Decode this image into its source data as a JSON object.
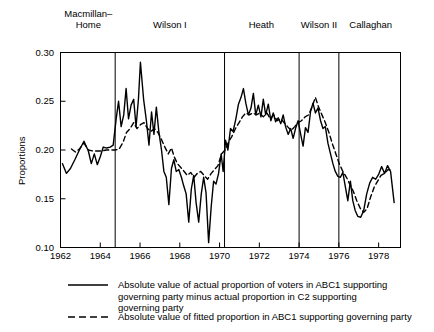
{
  "chart_data": {
    "type": "line",
    "title": "",
    "xlabel": "",
    "ylabel": "Proportions",
    "xlim": [
      1962.0,
      1979.1
    ],
    "ylim": [
      0.1,
      0.3
    ],
    "grid": false,
    "legend_position": "below-plot",
    "ytick_labels": [
      "0.30",
      "0.25",
      "0.20",
      "0.15",
      "0.10"
    ],
    "ytick_values": [
      0.3,
      0.25,
      0.2,
      0.15,
      0.1
    ],
    "xtick_labels": [
      "1962",
      "1964",
      "1966",
      "1968",
      "1970",
      "1972",
      "1974",
      "1976",
      "1978"
    ],
    "xtick_values": [
      1962,
      1964,
      1966,
      1968,
      1970,
      1972,
      1974,
      1976,
      1978
    ],
    "era_dividers": [
      1964.75,
      1970.25,
      1974.0,
      1976.0
    ],
    "eras": [
      {
        "label": "Macmillan–\nHome",
        "center": 1963.4
      },
      {
        "label": "Wilson I",
        "center": 1967.5
      },
      {
        "label": "Heath",
        "center": 1972.1
      },
      {
        "label": "Wilson II",
        "center": 1975.0
      },
      {
        "label": "Callaghan",
        "center": 1977.6
      }
    ],
    "series": [
      {
        "name": "actual",
        "style": "solid",
        "color": "#000000",
        "legend": "Absolute value of actual proportion of voters in ABC1 supporting governing party minus actual proportion in C2 supporting governing party",
        "points": [
          [
            1962.1,
            0.186
          ],
          [
            1962.3,
            0.176
          ],
          [
            1962.5,
            0.181
          ],
          [
            1962.72,
            0.19
          ],
          [
            1962.95,
            0.2
          ],
          [
            1963.18,
            0.209
          ],
          [
            1963.4,
            0.199
          ],
          [
            1963.55,
            0.186
          ],
          [
            1963.7,
            0.196
          ],
          [
            1963.85,
            0.185
          ],
          [
            1964.0,
            0.193
          ],
          [
            1964.15,
            0.203
          ],
          [
            1964.32,
            0.202
          ],
          [
            1964.5,
            0.203
          ],
          [
            1964.65,
            0.205
          ],
          [
            1964.8,
            0.232
          ],
          [
            1964.92,
            0.25
          ],
          [
            1965.05,
            0.224
          ],
          [
            1965.18,
            0.236
          ],
          [
            1965.3,
            0.263
          ],
          [
            1965.42,
            0.232
          ],
          [
            1965.55,
            0.246
          ],
          [
            1965.68,
            0.252
          ],
          [
            1965.8,
            0.224
          ],
          [
            1965.92,
            0.252
          ],
          [
            1966.02,
            0.29
          ],
          [
            1966.18,
            0.252
          ],
          [
            1966.32,
            0.23
          ],
          [
            1966.45,
            0.205
          ],
          [
            1966.58,
            0.239
          ],
          [
            1966.7,
            0.216
          ],
          [
            1966.82,
            0.244
          ],
          [
            1966.95,
            0.218
          ],
          [
            1967.08,
            0.2
          ],
          [
            1967.2,
            0.178
          ],
          [
            1967.32,
            0.172
          ],
          [
            1967.45,
            0.144
          ],
          [
            1967.58,
            0.181
          ],
          [
            1967.7,
            0.19
          ],
          [
            1967.82,
            0.178
          ],
          [
            1967.95,
            0.18
          ],
          [
            1968.08,
            0.172
          ],
          [
            1968.2,
            0.163
          ],
          [
            1968.32,
            0.155
          ],
          [
            1968.45,
            0.126
          ],
          [
            1968.58,
            0.16
          ],
          [
            1968.7,
            0.174
          ],
          [
            1968.82,
            0.146
          ],
          [
            1968.95,
            0.126
          ],
          [
            1969.08,
            0.155
          ],
          [
            1969.2,
            0.172
          ],
          [
            1969.32,
            0.156
          ],
          [
            1969.45,
            0.105
          ],
          [
            1969.58,
            0.142
          ],
          [
            1969.7,
            0.168
          ],
          [
            1969.82,
            0.165
          ],
          [
            1969.95,
            0.176
          ],
          [
            1970.08,
            0.196
          ],
          [
            1970.18,
            0.178
          ],
          [
            1970.3,
            0.21
          ],
          [
            1970.42,
            0.2
          ],
          [
            1970.55,
            0.222
          ],
          [
            1970.68,
            0.219
          ],
          [
            1970.82,
            0.232
          ],
          [
            1970.95,
            0.247
          ],
          [
            1971.08,
            0.254
          ],
          [
            1971.2,
            0.263
          ],
          [
            1971.32,
            0.248
          ],
          [
            1971.45,
            0.236
          ],
          [
            1971.58,
            0.243
          ],
          [
            1971.7,
            0.258
          ],
          [
            1971.82,
            0.236
          ],
          [
            1971.95,
            0.246
          ],
          [
            1972.08,
            0.234
          ],
          [
            1972.2,
            0.252
          ],
          [
            1972.32,
            0.236
          ],
          [
            1972.45,
            0.247
          ],
          [
            1972.58,
            0.23
          ],
          [
            1972.7,
            0.238
          ],
          [
            1972.82,
            0.229
          ],
          [
            1972.95,
            0.233
          ],
          [
            1973.08,
            0.227
          ],
          [
            1973.2,
            0.236
          ],
          [
            1973.32,
            0.224
          ],
          [
            1973.45,
            0.216
          ],
          [
            1973.58,
            0.222
          ],
          [
            1973.7,
            0.212
          ],
          [
            1973.82,
            0.222
          ],
          [
            1973.95,
            0.23
          ],
          [
            1974.08,
            0.216
          ],
          [
            1974.2,
            0.204
          ],
          [
            1974.32,
            0.223
          ],
          [
            1974.45,
            0.218
          ],
          [
            1974.58,
            0.24
          ],
          [
            1974.7,
            0.248
          ],
          [
            1974.82,
            0.238
          ],
          [
            1974.95,
            0.243
          ],
          [
            1975.08,
            0.23
          ],
          [
            1975.2,
            0.222
          ],
          [
            1975.32,
            0.224
          ],
          [
            1975.45,
            0.207
          ],
          [
            1975.58,
            0.196
          ],
          [
            1975.7,
            0.186
          ],
          [
            1975.82,
            0.178
          ],
          [
            1975.95,
            0.173
          ],
          [
            1976.08,
            0.172
          ],
          [
            1976.2,
            0.177
          ],
          [
            1976.32,
            0.163
          ],
          [
            1976.45,
            0.148
          ],
          [
            1976.58,
            0.168
          ],
          [
            1976.7,
            0.148
          ],
          [
            1976.82,
            0.138
          ],
          [
            1976.95,
            0.132
          ],
          [
            1977.1,
            0.131
          ],
          [
            1977.25,
            0.138
          ],
          [
            1977.4,
            0.155
          ],
          [
            1977.55,
            0.166
          ],
          [
            1977.7,
            0.172
          ],
          [
            1977.85,
            0.17
          ],
          [
            1978.0,
            0.175
          ],
          [
            1978.15,
            0.183
          ],
          [
            1978.3,
            0.176
          ],
          [
            1978.45,
            0.184
          ],
          [
            1978.6,
            0.178
          ],
          [
            1978.78,
            0.146
          ]
        ]
      },
      {
        "name": "fitted",
        "style": "dashed",
        "color": "#000000",
        "legend": "Absolute value of fitted proportion in ABC1 supporting governing party",
        "points": [
          [
            1962.55,
            0.201
          ],
          [
            1962.75,
            0.198
          ],
          [
            1962.95,
            0.201
          ],
          [
            1963.18,
            0.207
          ],
          [
            1963.4,
            0.2
          ],
          [
            1963.62,
            0.199
          ],
          [
            1963.85,
            0.199
          ],
          [
            1964.08,
            0.199
          ],
          [
            1964.3,
            0.2
          ],
          [
            1964.52,
            0.2
          ],
          [
            1964.75,
            0.2
          ],
          [
            1964.95,
            0.201
          ],
          [
            1965.15,
            0.208
          ],
          [
            1965.32,
            0.218
          ],
          [
            1965.5,
            0.222
          ],
          [
            1965.68,
            0.228
          ],
          [
            1965.85,
            0.222
          ],
          [
            1966.02,
            0.226
          ],
          [
            1966.2,
            0.228
          ],
          [
            1966.38,
            0.222
          ],
          [
            1966.55,
            0.219
          ],
          [
            1966.72,
            0.222
          ],
          [
            1966.9,
            0.218
          ],
          [
            1967.05,
            0.212
          ],
          [
            1967.25,
            0.203
          ],
          [
            1967.42,
            0.196
          ],
          [
            1967.58,
            0.202
          ],
          [
            1967.72,
            0.193
          ],
          [
            1967.88,
            0.186
          ],
          [
            1968.05,
            0.182
          ],
          [
            1968.22,
            0.178
          ],
          [
            1968.38,
            0.174
          ],
          [
            1968.55,
            0.177
          ],
          [
            1968.72,
            0.172
          ],
          [
            1968.88,
            0.176
          ],
          [
            1969.05,
            0.178
          ],
          [
            1969.22,
            0.174
          ],
          [
            1969.4,
            0.17
          ],
          [
            1969.58,
            0.176
          ],
          [
            1969.75,
            0.18
          ],
          [
            1969.92,
            0.184
          ],
          [
            1970.1,
            0.196
          ],
          [
            1970.28,
            0.2
          ],
          [
            1970.45,
            0.208
          ],
          [
            1970.62,
            0.214
          ],
          [
            1970.8,
            0.222
          ],
          [
            1970.98,
            0.228
          ],
          [
            1971.15,
            0.234
          ],
          [
            1971.32,
            0.238
          ],
          [
            1971.5,
            0.236
          ],
          [
            1971.68,
            0.238
          ],
          [
            1971.85,
            0.236
          ],
          [
            1972.02,
            0.238
          ],
          [
            1972.2,
            0.234
          ],
          [
            1972.38,
            0.238
          ],
          [
            1972.55,
            0.232
          ],
          [
            1972.72,
            0.236
          ],
          [
            1972.9,
            0.23
          ],
          [
            1973.08,
            0.232
          ],
          [
            1973.25,
            0.228
          ],
          [
            1973.42,
            0.224
          ],
          [
            1973.6,
            0.22
          ],
          [
            1973.78,
            0.224
          ],
          [
            1973.95,
            0.228
          ],
          [
            1974.12,
            0.23
          ],
          [
            1974.3,
            0.234
          ],
          [
            1974.48,
            0.236
          ],
          [
            1974.65,
            0.244
          ],
          [
            1974.82,
            0.254
          ],
          [
            1974.98,
            0.244
          ],
          [
            1975.15,
            0.236
          ],
          [
            1975.32,
            0.228
          ],
          [
            1975.5,
            0.218
          ],
          [
            1975.68,
            0.206
          ],
          [
            1975.85,
            0.196
          ],
          [
            1976.02,
            0.186
          ],
          [
            1976.2,
            0.178
          ],
          [
            1976.38,
            0.172
          ],
          [
            1976.55,
            0.165
          ],
          [
            1976.72,
            0.158
          ],
          [
            1976.9,
            0.148
          ],
          [
            1977.08,
            0.14
          ],
          [
            1977.25,
            0.136
          ],
          [
            1977.42,
            0.14
          ],
          [
            1977.6,
            0.152
          ],
          [
            1977.78,
            0.162
          ],
          [
            1977.95,
            0.168
          ],
          [
            1978.12,
            0.174
          ],
          [
            1978.3,
            0.176
          ],
          [
            1978.48,
            0.18
          ],
          [
            1978.65,
            0.179
          ]
        ]
      }
    ]
  },
  "legend": {
    "entries": [
      {
        "style": "solid",
        "lines": [
          "Absolute value of actual proportion of voters in ABC1 supporting",
          "governing party minus actual proportion in C2 supporting",
          "governing party"
        ]
      },
      {
        "style": "dashed",
        "lines": [
          "Absolute value of fitted proportion in ABC1 supporting governing party"
        ]
      }
    ]
  }
}
